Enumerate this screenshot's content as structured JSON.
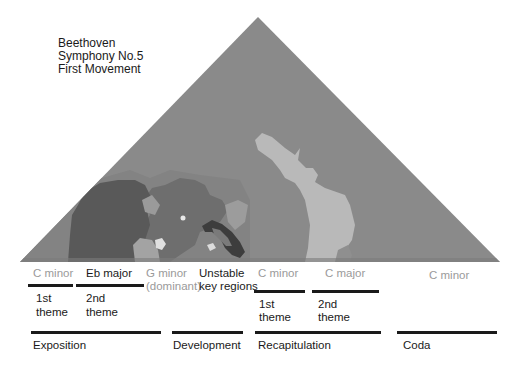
{
  "title": {
    "lines": [
      "Beethoven",
      "Symphony No.5",
      "First Movement"
    ]
  },
  "keyscape": {
    "shape": "triangle",
    "apex": [
      258,
      17
    ],
    "base_left": [
      20,
      262
    ],
    "base_right": [
      500,
      262
    ],
    "colors": {
      "background": "#8a8a8a",
      "c_minor_dark": "#595959",
      "eb_region": "#6e6e6e",
      "c_major_light": "#b9b9b9",
      "mid_grey": "#9c9c9c",
      "dark_ring": "#3d3d3d",
      "highlight": "#e8e8e8"
    }
  },
  "keys": [
    {
      "label": "C minor",
      "color": "#9a9a9a"
    },
    {
      "label": "Eb major",
      "color": "#1a1a1a"
    },
    {
      "label": "G minor",
      "color": "#9a9a9a"
    },
    {
      "label": "(dominant)",
      "color": "#9a9a9a"
    },
    {
      "label": "Unstable",
      "color": "#1a1a1a"
    },
    {
      "label": "key regions",
      "color": "#1a1a1a"
    },
    {
      "label": "C minor",
      "color": "#9a9a9a"
    },
    {
      "label": "C major",
      "color": "#9a9a9a"
    },
    {
      "label": "C minor",
      "color": "#9a9a9a"
    }
  ],
  "themes": [
    {
      "line1": "1st",
      "line2": "theme"
    },
    {
      "line1": "2nd",
      "line2": "theme"
    },
    {
      "line1": "1st",
      "line2": "theme"
    },
    {
      "line1": "2nd",
      "line2": "theme"
    }
  ],
  "sections": [
    {
      "label": "Exposition"
    },
    {
      "label": "Development"
    },
    {
      "label": "Recapitulation"
    },
    {
      "label": "Coda"
    }
  ]
}
